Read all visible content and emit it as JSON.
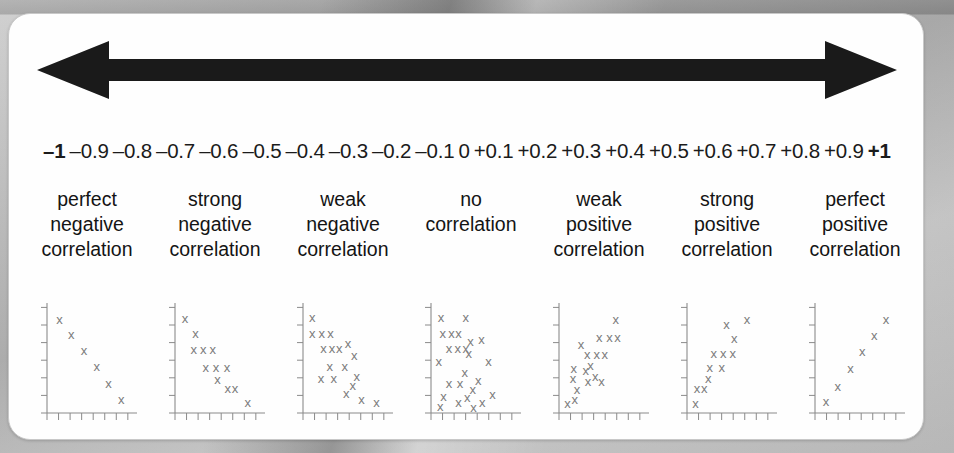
{
  "card": {
    "arrow": {
      "name": "double-headed-arrow",
      "color": "#1a1a1a"
    },
    "scale": {
      "ticks": [
        {
          "value": "–1",
          "bold": true
        },
        {
          "value": "–0.9",
          "bold": false
        },
        {
          "value": "–0.8",
          "bold": false
        },
        {
          "value": "–0.7",
          "bold": false
        },
        {
          "value": "–0.6",
          "bold": false
        },
        {
          "value": "–0.5",
          "bold": false
        },
        {
          "value": "–0.4",
          "bold": false
        },
        {
          "value": "–0.3",
          "bold": false
        },
        {
          "value": "–0.2",
          "bold": false
        },
        {
          "value": "–0.1",
          "bold": false
        },
        {
          "value": "0",
          "bold": false
        },
        {
          "value": "+0.1",
          "bold": false
        },
        {
          "value": "+0.2",
          "bold": false
        },
        {
          "value": "+0.3",
          "bold": false
        },
        {
          "value": "+0.4",
          "bold": false
        },
        {
          "value": "+0.5",
          "bold": false
        },
        {
          "value": "+0.6",
          "bold": false
        },
        {
          "value": "+0.7",
          "bold": false
        },
        {
          "value": "+0.8",
          "bold": false
        },
        {
          "value": "+0.9",
          "bold": false
        },
        {
          "value": "+1",
          "bold": true
        }
      ]
    },
    "categories": [
      {
        "line1": "perfect",
        "line2": "negative",
        "line3": "correlation"
      },
      {
        "line1": "strong",
        "line2": "negative",
        "line3": "correlation"
      },
      {
        "line1": "weak",
        "line2": "negative",
        "line3": "correlation"
      },
      {
        "line1": "no",
        "line2": "correlation",
        "line3": ""
      },
      {
        "line1": "weak",
        "line2": "positive",
        "line3": "correlation"
      },
      {
        "line1": "strong",
        "line2": "positive",
        "line3": "correlation"
      },
      {
        "line1": "perfect",
        "line2": "positive",
        "line3": "correlation"
      }
    ]
  },
  "chart_data": {
    "type": "scatter",
    "xlabel": "",
    "ylabel": "",
    "grid": false,
    "legend_position": "none",
    "marker": "x",
    "marker_color": "#7b7b7b",
    "axis_color": "#8a8a8a",
    "xlim": [
      0,
      10
    ],
    "ylim": [
      0,
      10
    ],
    "x_ticks": 8,
    "y_ticks": 7,
    "panels": [
      {
        "label": "perfect negative correlation",
        "r": -1.0,
        "points": [
          [
            1.2,
            9.0
          ],
          [
            2.7,
            7.6
          ],
          [
            4.3,
            6.0
          ],
          [
            5.9,
            4.5
          ],
          [
            7.4,
            2.9
          ],
          [
            9.0,
            1.3
          ]
        ]
      },
      {
        "label": "strong negative correlation",
        "r": -0.9,
        "points": [
          [
            0.9,
            9.1
          ],
          [
            2.2,
            7.7
          ],
          [
            2.0,
            6.1
          ],
          [
            3.2,
            6.1
          ],
          [
            4.4,
            6.1
          ],
          [
            3.5,
            4.4
          ],
          [
            4.8,
            4.4
          ],
          [
            6.2,
            4.4
          ],
          [
            5.0,
            3.2
          ],
          [
            6.3,
            2.4
          ],
          [
            7.2,
            2.4
          ],
          [
            8.8,
            1.0
          ]
        ]
      },
      {
        "label": "weak negative correlation",
        "r": -0.5,
        "points": [
          [
            0.8,
            9.2
          ],
          [
            0.8,
            7.7
          ],
          [
            2.0,
            7.7
          ],
          [
            3.1,
            7.7
          ],
          [
            2.2,
            6.2
          ],
          [
            3.3,
            6.2
          ],
          [
            4.2,
            6.2
          ],
          [
            5.3,
            6.7
          ],
          [
            6.1,
            5.6
          ],
          [
            3.0,
            4.5
          ],
          [
            4.9,
            4.5
          ],
          [
            1.9,
            3.3
          ],
          [
            3.5,
            3.3
          ],
          [
            6.4,
            3.5
          ],
          [
            5.9,
            2.7
          ],
          [
            5.1,
            1.9
          ],
          [
            7.0,
            1.3
          ],
          [
            8.9,
            1.0
          ]
        ]
      },
      {
        "label": "no correlation",
        "r": 0.0,
        "points": [
          [
            0.9,
            9.2
          ],
          [
            4.0,
            9.2
          ],
          [
            1.1,
            7.7
          ],
          [
            2.2,
            7.7
          ],
          [
            3.1,
            7.7
          ],
          [
            4.6,
            6.9
          ],
          [
            6.0,
            7.1
          ],
          [
            1.9,
            6.2
          ],
          [
            3.0,
            6.2
          ],
          [
            4.0,
            6.2
          ],
          [
            4.4,
            5.8
          ],
          [
            0.6,
            5.0
          ],
          [
            6.9,
            5.0
          ],
          [
            3.9,
            3.9
          ],
          [
            1.9,
            2.9
          ],
          [
            3.3,
            2.9
          ],
          [
            5.6,
            3.1
          ],
          [
            4.9,
            2.3
          ],
          [
            1.2,
            1.6
          ],
          [
            4.2,
            1.5
          ],
          [
            3.1,
            1.0
          ],
          [
            6.1,
            1.0
          ],
          [
            0.8,
            0.6
          ],
          [
            5.0,
            0.5
          ],
          [
            7.4,
            1.8
          ]
        ]
      },
      {
        "label": "weak positive correlation",
        "r": 0.5,
        "points": [
          [
            0.7,
            0.9
          ],
          [
            1.6,
            1.3
          ],
          [
            1.9,
            2.3
          ],
          [
            1.4,
            3.3
          ],
          [
            1.5,
            4.3
          ],
          [
            3.0,
            4.1
          ],
          [
            4.2,
            3.5
          ],
          [
            3.3,
            3.0
          ],
          [
            5.0,
            3.0
          ],
          [
            3.2,
            5.7
          ],
          [
            4.4,
            5.7
          ],
          [
            5.4,
            5.7
          ],
          [
            2.4,
            6.6
          ],
          [
            4.7,
            7.3
          ],
          [
            6.0,
            7.3
          ],
          [
            7.0,
            7.3
          ],
          [
            6.8,
            9.0
          ],
          [
            3.6,
            4.6
          ]
        ]
      },
      {
        "label": "strong positive correlation",
        "r": 0.9,
        "points": [
          [
            0.7,
            0.9
          ],
          [
            0.9,
            2.4
          ],
          [
            1.8,
            2.4
          ],
          [
            2.3,
            3.3
          ],
          [
            2.5,
            4.4
          ],
          [
            4.0,
            4.4
          ],
          [
            3.0,
            5.8
          ],
          [
            4.2,
            5.8
          ],
          [
            5.4,
            5.8
          ],
          [
            5.6,
            7.2
          ],
          [
            4.6,
            8.6
          ],
          [
            7.2,
            9.0
          ]
        ]
      },
      {
        "label": "perfect positive correlation",
        "r": 1.0,
        "points": [
          [
            1.0,
            1.1
          ],
          [
            2.5,
            2.6
          ],
          [
            4.1,
            4.3
          ],
          [
            5.6,
            5.9
          ],
          [
            7.1,
            7.5
          ],
          [
            8.6,
            9.0
          ]
        ]
      }
    ]
  }
}
